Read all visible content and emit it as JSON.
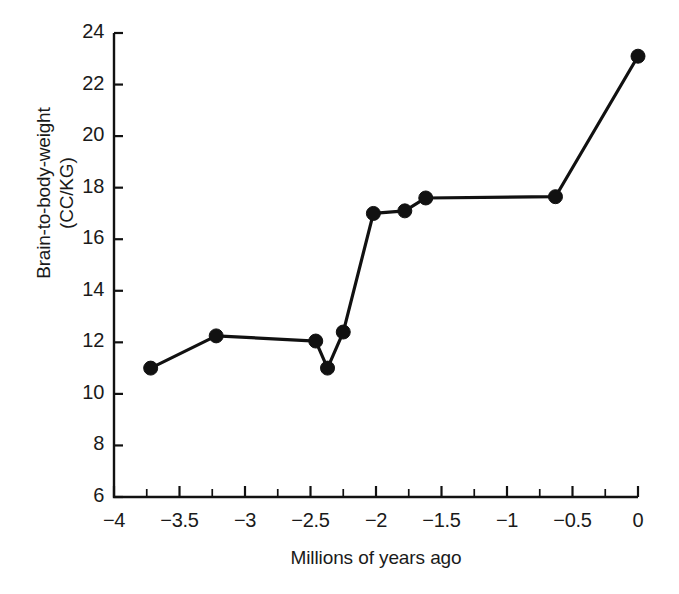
{
  "chart_data": {
    "type": "line",
    "title": "",
    "xlabel": "Millions of years ago",
    "ylabel": "Brain-to-body-weight\n(CC/KG)",
    "ylabel_line1": "Brain-to-body-weight",
    "ylabel_line2": "(CC/KG)",
    "xlim": [
      -4,
      0
    ],
    "ylim": [
      6,
      24
    ],
    "grid": false,
    "legend": null,
    "x_major_ticks": [
      -4,
      -3.5,
      -3,
      -2.5,
      -2,
      -1.5,
      -1,
      -0.5,
      0
    ],
    "x_tick_labels": [
      "−4",
      "−3.5",
      "−3",
      "−2.5",
      "−2",
      "−1.5",
      "−1",
      "−0.5",
      "0"
    ],
    "x_minor_tick_interval": 0.25,
    "y_major_ticks": [
      6,
      8,
      10,
      12,
      14,
      16,
      18,
      20,
      22,
      24
    ],
    "y_tick_labels": [
      "6",
      "8",
      "10",
      "12",
      "14",
      "16",
      "18",
      "20",
      "22",
      "24"
    ],
    "y_tick_interval": 2,
    "marker": "filled-circle",
    "marker_color": "#111111",
    "line_color": "#111111",
    "series": [
      {
        "name": "Brain-to-body-weight",
        "points": [
          {
            "x": -3.72,
            "y": 11.0
          },
          {
            "x": -3.22,
            "y": 12.25
          },
          {
            "x": -2.46,
            "y": 12.05
          },
          {
            "x": -2.37,
            "y": 11.0
          },
          {
            "x": -2.25,
            "y": 12.4
          },
          {
            "x": -2.02,
            "y": 17.0
          },
          {
            "x": -1.78,
            "y": 17.1
          },
          {
            "x": -1.62,
            "y": 17.6
          },
          {
            "x": -0.63,
            "y": 17.65
          },
          {
            "x": 0.0,
            "y": 23.1
          }
        ]
      }
    ]
  },
  "colors": {
    "ink": "#111111",
    "background": "#ffffff"
  }
}
